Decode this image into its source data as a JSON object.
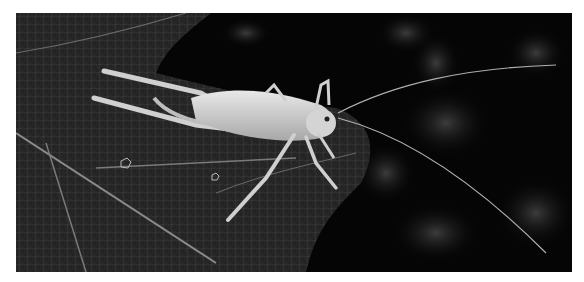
{
  "image": {
    "subject": "katydid on leaf",
    "style": "black and white macro photograph",
    "border_color": "#ffffff",
    "background_color": "#050505",
    "leaf_color": "#3a3a3a",
    "insect_color": "#d8d8d8"
  }
}
